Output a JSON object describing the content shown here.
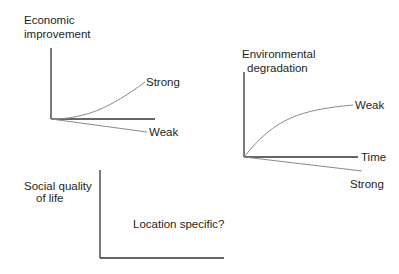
{
  "panels": {
    "economic": {
      "title_line1": "Economic",
      "title_line2": "improvement",
      "curve_up_label": "Strong",
      "curve_down_label": "Weak"
    },
    "environmental": {
      "title_line1": "Environmental",
      "title_line2": "degradation",
      "curve_up_label": "Weak",
      "curve_down_label": "Strong",
      "x_axis_label": "Time"
    },
    "social": {
      "title_line1": "Social quality",
      "title_line2": "of life",
      "annotation": "Location specific?"
    }
  },
  "colors": {
    "axis": "#333333",
    "curve": "#8a8a8a",
    "text": "#1e1e1e"
  }
}
